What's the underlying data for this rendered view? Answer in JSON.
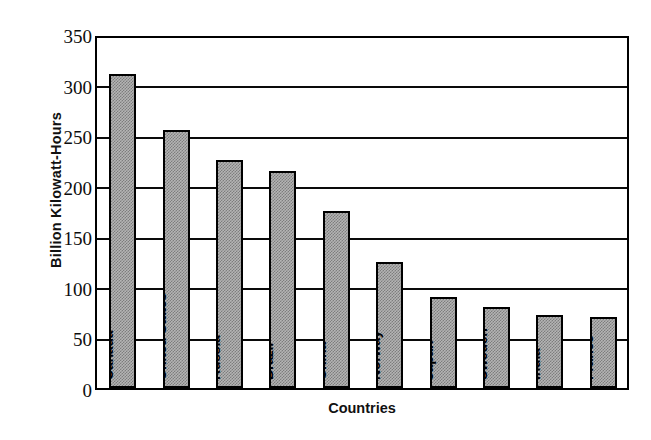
{
  "chart_data": {
    "type": "bar",
    "title": "",
    "xlabel": "Countries",
    "ylabel": "Billion Kilowatt-Hours",
    "ylim": [
      0,
      350
    ],
    "ytick_step": 50,
    "yticks": [
      350,
      300,
      250,
      200,
      150,
      100,
      50,
      0
    ],
    "ytick_labels": [
      "350",
      "300",
      "250",
      "200",
      "150",
      "100",
      "50",
      "0"
    ],
    "grid": "horizontal",
    "legend": "none",
    "categories": [
      "Canada",
      "United States",
      "Russia",
      "Brazil",
      "China",
      "Norway",
      "Japan",
      "Sweden",
      "India",
      "France"
    ],
    "values": [
      310,
      255,
      225,
      215,
      175,
      125,
      90,
      80,
      72,
      70
    ],
    "series": [
      {
        "name": "Hydroelectric generation",
        "values": [
          310,
          255,
          225,
          215,
          175,
          125,
          90,
          80,
          72,
          70
        ]
      }
    ],
    "bar_fill": "#b4b4b4",
    "bar_pattern": "stipple-checker",
    "bar_border": "#000000",
    "axis_color": "#000000",
    "background": "#ffffff"
  }
}
